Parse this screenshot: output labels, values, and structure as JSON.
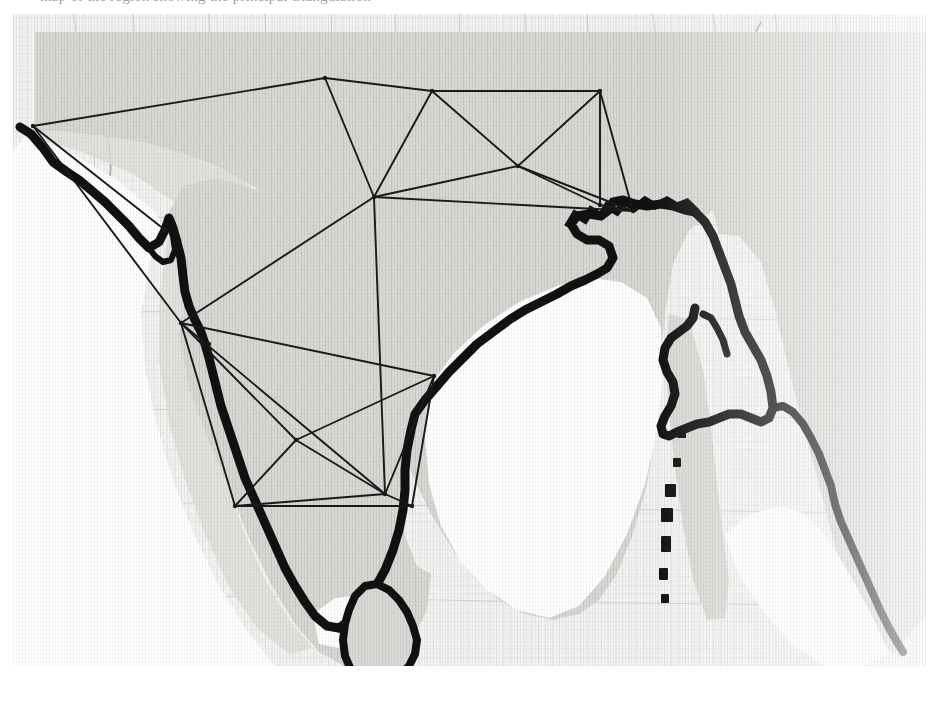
{
  "figure": {
    "caption_fragment": "map of the region showing the principal triangulation",
    "alt_title": "Scanned historical map of the Indian subcontinent with a triangulation survey network overlaid",
    "image_region": {
      "x": 13,
      "y": 14,
      "width": 913,
      "height": 652
    }
  },
  "colors": {
    "page_background": "#ffffff",
    "paper_light": "#f2f2f0",
    "landmass_fill": "#d6d6d2",
    "landmass_fill_light": "#e4e4e1",
    "ocean_white": "#ffffff",
    "coastline_ink": "#0d0d0d",
    "network_ink": "#1a1a1a",
    "faint_map_detail": "#b9b9bd",
    "caption_text": "#8d8d95"
  },
  "map": {
    "landmass_outline_name": "indian-subcontinent-landmass",
    "coastline_name": "heavy-inked-coastline",
    "islands": [
      {
        "name": "sri-lanka",
        "label": "Sri Lanka"
      },
      {
        "name": "andaman-nicobar-chain",
        "label": "Andaman and Nicobar chain"
      }
    ],
    "water_bodies": [
      {
        "name": "bay-of-bengal",
        "label": "Bay of Bengal"
      },
      {
        "name": "arabian-sea",
        "label": "Arabian Sea"
      },
      {
        "name": "andaman-sea",
        "label": "Andaman Sea"
      }
    ]
  },
  "chart_data": {
    "type": "network",
    "xlabel": "",
    "ylabel": "",
    "grid": false,
    "legend": "none",
    "units": "pixels in the scanned figure",
    "xlim": [
      0,
      913
    ],
    "ylim": [
      0,
      652
    ],
    "node_count": 16,
    "edge_count": 30,
    "nodes": [
      {
        "id": "n01",
        "label": "north-west-terminus",
        "x": 20,
        "y": 112
      },
      {
        "id": "n02",
        "label": "north-apex",
        "x": 312,
        "y": 64
      },
      {
        "id": "n03",
        "label": "north-east-of-apex",
        "x": 419,
        "y": 77
      },
      {
        "id": "n04",
        "label": "north-east-corner",
        "x": 587,
        "y": 77
      },
      {
        "id": "n05",
        "label": "central-hub",
        "x": 361,
        "y": 183
      },
      {
        "id": "n06",
        "label": "mid-east-junction",
        "x": 505,
        "y": 152
      },
      {
        "id": "n07",
        "label": "east-coast-junction",
        "x": 587,
        "y": 191
      },
      {
        "id": "n08",
        "label": "east-coast-lower",
        "x": 620,
        "y": 197
      },
      {
        "id": "n09",
        "label": "west-coast-junction",
        "x": 168,
        "y": 309
      },
      {
        "id": "n10",
        "label": "deccan-west",
        "x": 283,
        "y": 426
      },
      {
        "id": "n11",
        "label": "deccan-central",
        "x": 372,
        "y": 480
      },
      {
        "id": "n12",
        "label": "coromandel-junction",
        "x": 421,
        "y": 362
      },
      {
        "id": "n13",
        "label": "south-west-coast",
        "x": 222,
        "y": 492
      },
      {
        "id": "n14",
        "label": "south-coast-terminus",
        "x": 399,
        "y": 492
      },
      {
        "id": "n15",
        "label": "konkan-coast-node",
        "x": 152,
        "y": 216
      },
      {
        "id": "n16",
        "label": "malabar-coast-node",
        "x": 196,
        "y": 330
      }
    ],
    "edges": [
      [
        "n01",
        "n02"
      ],
      [
        "n01",
        "n09"
      ],
      [
        "n01",
        "n15"
      ],
      [
        "n02",
        "n03"
      ],
      [
        "n02",
        "n05"
      ],
      [
        "n03",
        "n04"
      ],
      [
        "n03",
        "n05"
      ],
      [
        "n03",
        "n06"
      ],
      [
        "n04",
        "n06"
      ],
      [
        "n04",
        "n07"
      ],
      [
        "n04",
        "n08"
      ],
      [
        "n05",
        "n06"
      ],
      [
        "n05",
        "n09"
      ],
      [
        "n05",
        "n11"
      ],
      [
        "n06",
        "n07"
      ],
      [
        "n06",
        "n08"
      ],
      [
        "n07",
        "n08"
      ],
      [
        "n05",
        "n08"
      ],
      [
        "n09",
        "n10"
      ],
      [
        "n09",
        "n11"
      ],
      [
        "n09",
        "n12"
      ],
      [
        "n09",
        "n13"
      ],
      [
        "n10",
        "n11"
      ],
      [
        "n10",
        "n12"
      ],
      [
        "n10",
        "n13"
      ],
      [
        "n11",
        "n12"
      ],
      [
        "n11",
        "n13"
      ],
      [
        "n11",
        "n14"
      ],
      [
        "n12",
        "n14"
      ],
      [
        "n13",
        "n14"
      ]
    ]
  }
}
